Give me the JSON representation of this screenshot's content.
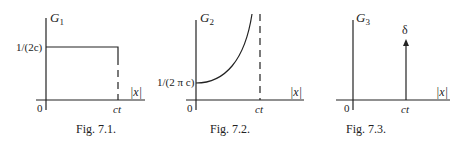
{
  "figures": [
    {
      "caption": "Fig. 7.1.",
      "ylabel": "G",
      "ylabel_sub": "1",
      "y_tick": "1/(2c)",
      "x_label": "|x|",
      "origin": "0",
      "x_tick": "ct",
      "shape": "step"
    },
    {
      "caption": "Fig. 7.2.",
      "ylabel": "G",
      "ylabel_sub": "2",
      "y_tick": "1/(2 π c)",
      "x_label": "|x|",
      "origin": "0",
      "x_tick": "ct",
      "shape": "diverging-curve"
    },
    {
      "caption": "Fig. 7.3.",
      "ylabel": "G",
      "ylabel_sub": "3",
      "impulse_label": "δ",
      "x_label": "|x|",
      "origin": "0",
      "x_tick": "ct",
      "shape": "delta"
    }
  ]
}
